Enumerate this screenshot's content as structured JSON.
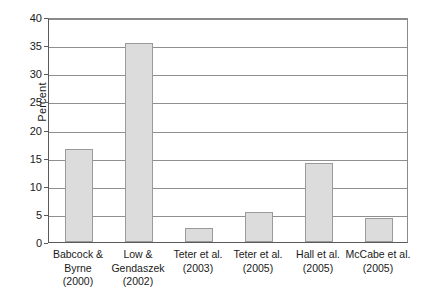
{
  "chart_data": {
    "type": "bar",
    "title": "",
    "subtitle": "",
    "xlabel": "",
    "ylabel": "Percent",
    "ylim": [
      0,
      40
    ],
    "ytick_step": 5,
    "yticks": [
      0,
      5,
      10,
      15,
      20,
      25,
      30,
      35,
      40
    ],
    "ytick_labels": [
      "0",
      "5",
      "10",
      "15",
      "20",
      "25",
      "30",
      "35",
      "40"
    ],
    "grid": true,
    "grid_axis": "y",
    "legend": false,
    "legend_position": "none",
    "categories": [
      "Babcock &\nByrne\n(2000)",
      "Low &\nGendaszek\n(2002)",
      "Teter et al.\n(2003)",
      "Teter et al.\n(2005)",
      "Hall et al.\n(2005)",
      "McCabe et al.\n(2005)"
    ],
    "category_lines": [
      [
        "Babcock &",
        "Byrne",
        "(2000)"
      ],
      [
        "Low &",
        "Gendaszek",
        "(2002)"
      ],
      [
        "Teter et al.",
        "(2003)"
      ],
      [
        "Teter et al.",
        "(2005)"
      ],
      [
        "Hall et al.",
        "(2005)"
      ],
      [
        "McCabe et al.",
        "(2005)"
      ]
    ],
    "values": [
      16.5,
      35.3,
      2.5,
      5.4,
      14.0,
      4.2
    ],
    "series": [
      {
        "name": "Percent",
        "values": [
          16.5,
          35.3,
          2.5,
          5.4,
          14.0,
          4.2
        ]
      }
    ]
  },
  "style": {
    "bar_fill": "#dcdcdc",
    "bar_border": "#9a9a9a",
    "grid_color": "#8f8f8f",
    "axis_color": "#5a5a5a",
    "background": "#ffffff",
    "text_color": "#1a1a1a"
  }
}
